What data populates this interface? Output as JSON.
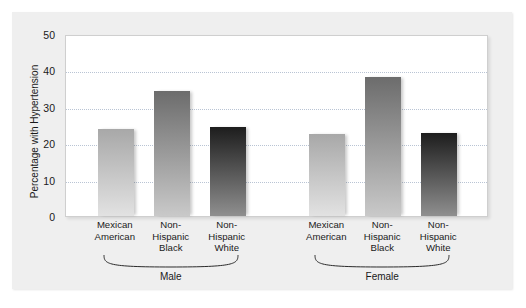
{
  "chart_data": {
    "type": "bar",
    "title": "",
    "xlabel": "",
    "ylabel": "Percentage with Hypertension",
    "ylim": [
      0,
      50
    ],
    "yticks": [
      0,
      10,
      20,
      30,
      40,
      50
    ],
    "ytick_labels": [
      "0",
      "10",
      "20",
      "30",
      "40",
      "50"
    ],
    "grid": true,
    "legend": "none",
    "groups": [
      "Male",
      "Female"
    ],
    "categories": [
      "Mexican American",
      "Non-Hispanic Black",
      "Non-Hispanic White"
    ],
    "category_lines": [
      [
        "Mexican",
        "American"
      ],
      [
        "Non-",
        "Hispanic",
        "Black"
      ],
      [
        "Non-",
        "Hispanic",
        "White"
      ]
    ],
    "series": [
      {
        "name": "Male",
        "values": [
          23.8,
          34.3,
          24.5
        ]
      },
      {
        "name": "Female",
        "values": [
          22.4,
          38.2,
          22.8
        ]
      }
    ],
    "bars": [
      {
        "group": "Male",
        "category": "Mexican American",
        "value": 23.8,
        "color_top": "#a8a8a8",
        "color_bottom": "#e2e2e2"
      },
      {
        "group": "Male",
        "category": "Non-Hispanic Black",
        "value": 34.3,
        "color_top": "#6c6c6c",
        "color_bottom": "#c9c9c9"
      },
      {
        "group": "Male",
        "category": "Non-Hispanic White",
        "value": 24.5,
        "color_top": "#1d1d1d",
        "color_bottom": "#8f8f8f"
      },
      {
        "group": "Female",
        "category": "Mexican American",
        "value": 22.4,
        "color_top": "#a8a8a8",
        "color_bottom": "#e2e2e2"
      },
      {
        "group": "Female",
        "category": "Non-Hispanic Black",
        "value": 38.2,
        "color_top": "#6c6c6c",
        "color_bottom": "#c9c9c9"
      },
      {
        "group": "Female",
        "category": "Non-Hispanic White",
        "value": 22.8,
        "color_top": "#1d1d1d",
        "color_bottom": "#8f8f8f"
      }
    ]
  },
  "colors": {
    "figure_background": "#efefef",
    "plot_background": "#ffffff",
    "plot_border": "#cfcfcf",
    "gridline": "#b9c4d4",
    "text": "#1a1a1a"
  }
}
